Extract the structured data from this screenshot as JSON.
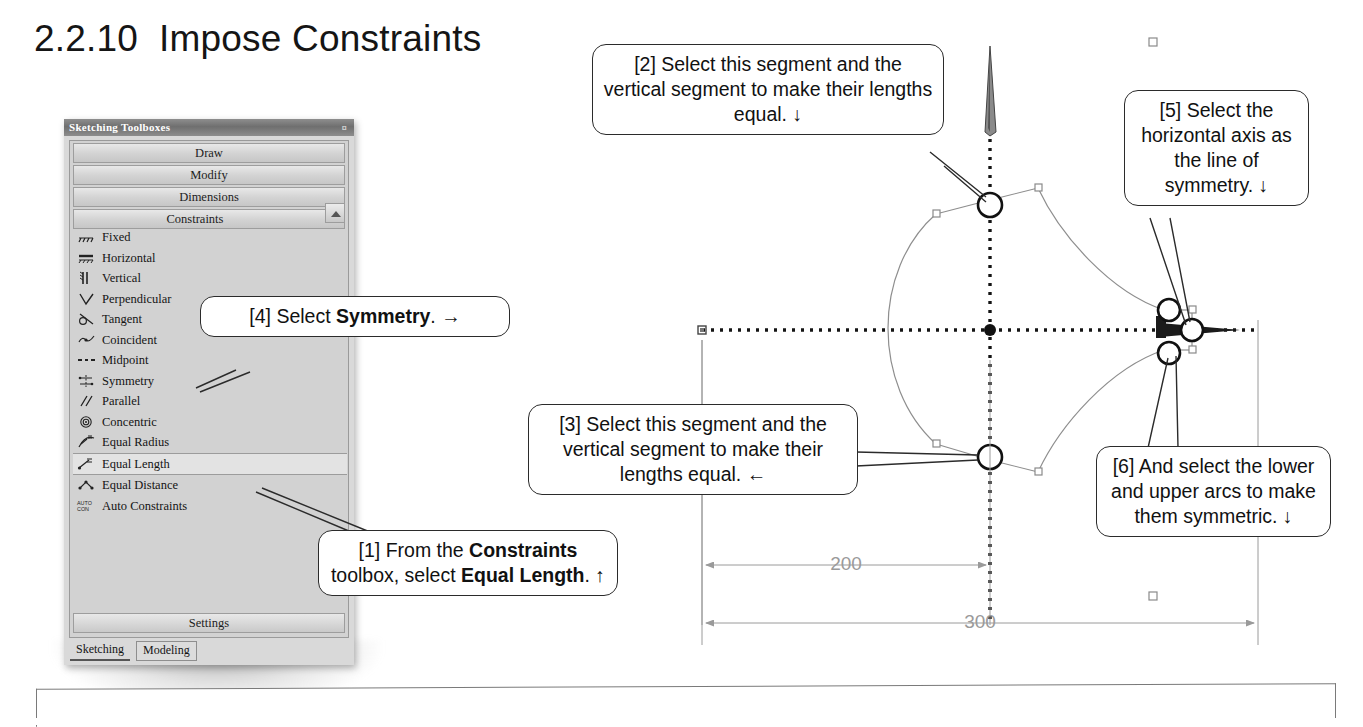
{
  "page": {
    "title": "2.2.10  Impose Constraints"
  },
  "toolbox": {
    "window_title": "Sketching Toolboxes",
    "close_glyph": "¤",
    "sections": [
      {
        "label": "Draw"
      },
      {
        "label": "Modify"
      },
      {
        "label": "Dimensions"
      },
      {
        "label": "Constraints"
      }
    ],
    "expanded_section": "Constraints",
    "collapse_arrow_icon": "chevron-up-icon",
    "items": [
      {
        "label": "Fixed",
        "icon": "fixed-constraint-icon",
        "selected": false
      },
      {
        "label": "Horizontal",
        "icon": "horizontal-constraint-icon",
        "selected": false
      },
      {
        "label": "Vertical",
        "icon": "vertical-constraint-icon",
        "selected": false
      },
      {
        "label": "Perpendicular",
        "icon": "perpendicular-constraint-icon",
        "selected": false
      },
      {
        "label": "Tangent",
        "icon": "tangent-constraint-icon",
        "selected": false
      },
      {
        "label": "Coincident",
        "icon": "coincident-constraint-icon",
        "selected": false
      },
      {
        "label": "Midpoint",
        "icon": "midpoint-constraint-icon",
        "selected": false
      },
      {
        "label": "Symmetry",
        "icon": "symmetry-constraint-icon",
        "selected": false
      },
      {
        "label": "Parallel",
        "icon": "parallel-constraint-icon",
        "selected": false
      },
      {
        "label": "Concentric",
        "icon": "concentric-constraint-icon",
        "selected": false
      },
      {
        "label": "Equal Radius",
        "icon": "equal-radius-constraint-icon",
        "selected": false
      },
      {
        "label": "Equal Length",
        "icon": "equal-length-constraint-icon",
        "selected": true
      },
      {
        "label": "Equal Distance",
        "icon": "equal-distance-constraint-icon",
        "selected": false
      },
      {
        "label": "Auto Constraints",
        "icon": "auto-constraints-icon",
        "selected": false
      }
    ],
    "settings_label": "Settings",
    "tabs": [
      {
        "label": "Sketching",
        "active": true
      },
      {
        "label": "Modeling",
        "active": false
      }
    ]
  },
  "callouts": {
    "c1": {
      "text_1": "[1] From the ",
      "bold_1": "Constraints",
      "text_2": " toolbox, select ",
      "bold_2": "Equal Length",
      "text_3": ". ↑"
    },
    "c2": {
      "text": "[2] Select this segment and the vertical segment to make their lengths equal. ↓"
    },
    "c3": {
      "text": "[3] Select this segment and the vertical segment to make their lengths equal. ←"
    },
    "c4": {
      "text_1": "[4] Select ",
      "bold_1": "Symmetry",
      "text_2": ". →"
    },
    "c5": {
      "text": "[5] Select the horizontal axis as the line of symmetry. ↓"
    },
    "c6": {
      "text": "[6] And select the lower and upper arcs to make them symmetric. ↓"
    }
  },
  "sketch": {
    "dimensions": [
      {
        "value": "200"
      },
      {
        "value": "300"
      }
    ],
    "axes": {
      "horizontal_axis": "dotted-horizontal-axis",
      "vertical_axis": "dotted-vertical-axis",
      "origin": "sketch-origin-point"
    },
    "selection_markers": 5
  },
  "colors": {
    "ink": "#111111",
    "panel_bg": "#d2d2d2",
    "panel_title_bg": "#7a7a7a",
    "sketch_line": "#8c8c8c",
    "axis": "#1a1a1a",
    "dimension": "#9a9a9a"
  }
}
